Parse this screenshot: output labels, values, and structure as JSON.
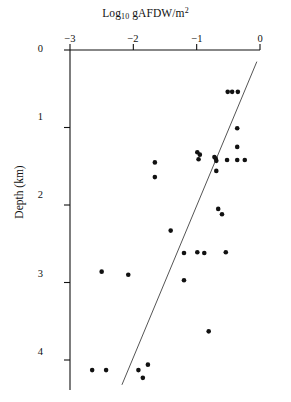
{
  "chart_data": {
    "type": "scatter",
    "title": "",
    "xlabel": "Log10 gAFDW/m2",
    "xlabel_parts": {
      "base": "Log",
      "subscript": "10",
      "unit": " gAFDW/m",
      "superscript": "2"
    },
    "ylabel": "Depth (km)",
    "xlim": [
      -3,
      0
    ],
    "ylim": [
      0,
      4.4
    ],
    "y_inverted": true,
    "xticks": [
      -3,
      -2,
      -1,
      0
    ],
    "xticklabels": [
      "−3",
      "−2",
      "−1",
      "0"
    ],
    "yticks": [
      0,
      1,
      2,
      3,
      4
    ],
    "yticklabels": [
      "0",
      "1",
      "2",
      "3",
      "4"
    ],
    "grid": false,
    "legend": null,
    "axis_position": {
      "x_axis": "top",
      "y_axis": "left"
    },
    "marker": {
      "shape": "circle",
      "color": "#111111",
      "size": 4.6
    },
    "points": [
      {
        "x": -0.51,
        "y": 0.54
      },
      {
        "x": -0.44,
        "y": 0.54
      },
      {
        "x": -0.35,
        "y": 0.54
      },
      {
        "x": -0.36,
        "y": 1.01
      },
      {
        "x": -0.99,
        "y": 1.32
      },
      {
        "x": -0.95,
        "y": 1.35
      },
      {
        "x": -0.72,
        "y": 1.38
      },
      {
        "x": -0.7,
        "y": 1.4
      },
      {
        "x": -0.69,
        "y": 1.43
      },
      {
        "x": -0.36,
        "y": 1.25
      },
      {
        "x": -0.97,
        "y": 1.41
      },
      {
        "x": -0.36,
        "y": 1.42
      },
      {
        "x": -0.52,
        "y": 1.42
      },
      {
        "x": -0.24,
        "y": 1.42
      },
      {
        "x": -0.69,
        "y": 1.56
      },
      {
        "x": -1.66,
        "y": 1.45
      },
      {
        "x": -1.66,
        "y": 1.64
      },
      {
        "x": -0.66,
        "y": 2.05
      },
      {
        "x": -0.6,
        "y": 2.12
      },
      {
        "x": -1.41,
        "y": 2.33
      },
      {
        "x": -1.2,
        "y": 2.62
      },
      {
        "x": -0.99,
        "y": 2.61
      },
      {
        "x": -0.88,
        "y": 2.62
      },
      {
        "x": -0.54,
        "y": 2.61
      },
      {
        "x": -2.5,
        "y": 2.86
      },
      {
        "x": -2.08,
        "y": 2.9
      },
      {
        "x": -1.2,
        "y": 2.97
      },
      {
        "x": -0.81,
        "y": 3.63
      },
      {
        "x": -2.65,
        "y": 4.13
      },
      {
        "x": -2.43,
        "y": 4.13
      },
      {
        "x": -1.92,
        "y": 4.13
      },
      {
        "x": -1.77,
        "y": 4.06
      },
      {
        "x": -1.85,
        "y": 4.23
      }
    ],
    "trendline": {
      "type": "linear-fit",
      "color": "#555555",
      "x_start": -2.18,
      "y_start": 4.32,
      "x_end": -0.05,
      "y_end": 0.15
    }
  }
}
